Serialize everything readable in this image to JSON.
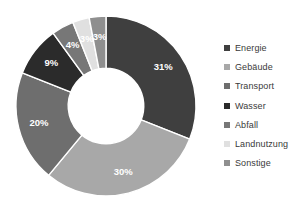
{
  "chart_data": {
    "type": "pie",
    "variant": "donut",
    "title": "",
    "subtitle": "",
    "xlabel": "",
    "ylabel": "",
    "grid": false,
    "legend_position": "right",
    "start_angle_deg": 0,
    "direction": "clockwise",
    "inner_radius_ratio": 0.42,
    "value_unit": "%",
    "categories": [
      "Energie",
      "Gebäude",
      "Transport",
      "Wasser",
      "Abfall",
      "Landnutzung",
      "Sonstige"
    ],
    "values": [
      31,
      30,
      20,
      9,
      4,
      3,
      3
    ],
    "data_labels": [
      "31%",
      "30%",
      "20%",
      "9%",
      "4%",
      "3%",
      "3%"
    ],
    "colors": [
      "#3f3f3f",
      "#a8a8a8",
      "#6e6e6e",
      "#2b2b2b",
      "#777777",
      "#e0e0e0",
      "#8f8f8f"
    ],
    "slices": [
      {
        "label": "Energie",
        "value": 31,
        "data_label": "31%",
        "color": "#3f3f3f"
      },
      {
        "label": "Gebäude",
        "value": 30,
        "data_label": "30%",
        "color": "#a8a8a8"
      },
      {
        "label": "Transport",
        "value": 20,
        "data_label": "20%",
        "color": "#6e6e6e"
      },
      {
        "label": "Wasser",
        "value": 9,
        "data_label": "9%",
        "color": "#2b2b2b"
      },
      {
        "label": "Abfall",
        "value": 4,
        "data_label": "4%",
        "color": "#777777"
      },
      {
        "label": "Landnutzung",
        "value": 3,
        "data_label": "3%",
        "color": "#e0e0e0"
      },
      {
        "label": "Sonstige",
        "value": 3,
        "data_label": "3%",
        "color": "#8f8f8f"
      }
    ]
  },
  "legend": {
    "items": [
      {
        "label": "Energie",
        "color": "#3f3f3f"
      },
      {
        "label": "Gebäude",
        "color": "#a8a8a8"
      },
      {
        "label": "Transport",
        "color": "#6e6e6e"
      },
      {
        "label": "Wasser",
        "color": "#2b2b2b"
      },
      {
        "label": "Abfall",
        "color": "#777777"
      },
      {
        "label": "Landnutzung",
        "color": "#e0e0e0"
      },
      {
        "label": "Sonstige",
        "color": "#8f8f8f"
      }
    ]
  },
  "style": {
    "background": "#ffffff",
    "label_text_color": "#ffffff",
    "legend_text_color": "#3a3a3a",
    "slice_separator_color": "#ffffff"
  }
}
